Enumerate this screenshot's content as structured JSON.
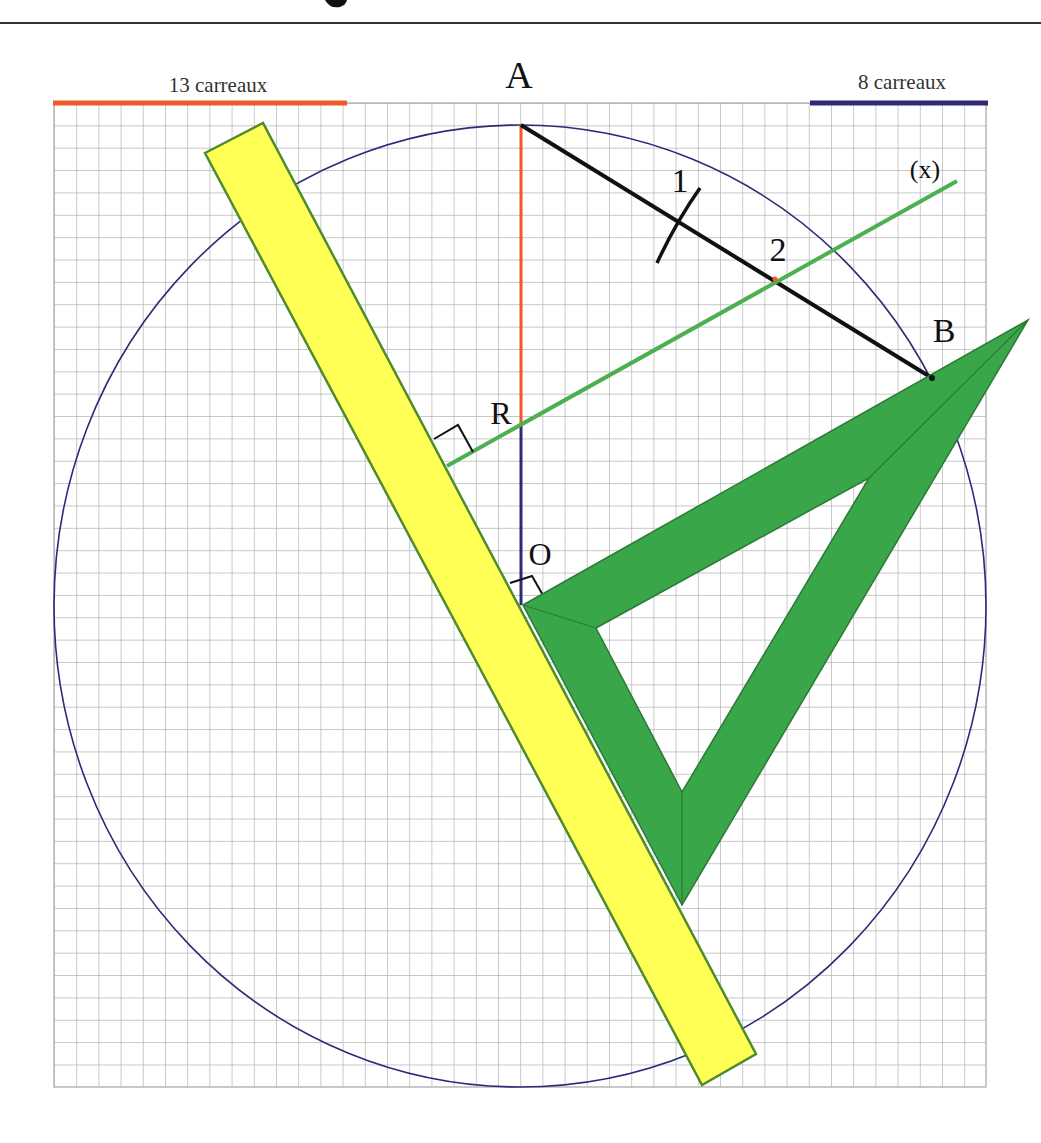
{
  "title_fragment": "g",
  "colors": {
    "grid": "#b3b3b3",
    "circle": "#2e2a78",
    "orange": "#ee5a2a",
    "navy": "#2e2a78",
    "segment_ab": "#111111",
    "mediatrice": "#4caf50",
    "ruler_fill": "#ffff55",
    "ruler_stroke": "#4f8c2e",
    "set_square_fill": "#3aa64a",
    "set_square_stroke": "#2b7a35"
  },
  "scale": {
    "left_label": "13 carreaux",
    "right_label": "8 carreaux"
  },
  "points": {
    "A": "A",
    "B": "B",
    "R": "R",
    "O": "O",
    "mark1": "1",
    "mark2": "2",
    "line_x": "(x)"
  },
  "grid": {
    "columns": 42,
    "rows": 44,
    "cell_px": 22.2
  }
}
